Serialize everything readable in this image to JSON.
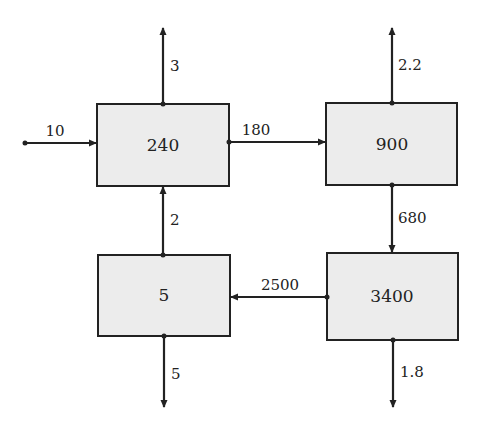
{
  "diagram": {
    "colors": {
      "box_fill": "#ececec",
      "stroke": "#222222",
      "background": "#ffffff"
    },
    "boxes": [
      {
        "id": "box-240",
        "label": "240",
        "x": 97,
        "y": 104,
        "w": 132,
        "h": 82
      },
      {
        "id": "box-900",
        "label": "900",
        "x": 326,
        "y": 103,
        "w": 131,
        "h": 82
      },
      {
        "id": "box-5",
        "label": "5",
        "x": 98,
        "y": 255,
        "w": 132,
        "h": 81
      },
      {
        "id": "box-3400",
        "label": "3400",
        "x": 327,
        "y": 253,
        "w": 131,
        "h": 87
      }
    ],
    "flows": [
      {
        "id": "flow-in-10",
        "label": "10",
        "from": "external",
        "to": "240"
      },
      {
        "id": "flow-out-3",
        "label": "3",
        "from": "240",
        "to": "external"
      },
      {
        "id": "flow-180",
        "label": "180",
        "from": "240",
        "to": "900"
      },
      {
        "id": "flow-out-2-2",
        "label": "2.2",
        "from": "900",
        "to": "external"
      },
      {
        "id": "flow-680",
        "label": "680",
        "from": "900",
        "to": "3400"
      },
      {
        "id": "flow-2500",
        "label": "2500",
        "from": "3400",
        "to": "5"
      },
      {
        "id": "flow-2",
        "label": "2",
        "from": "5",
        "to": "240"
      },
      {
        "id": "flow-out-5",
        "label": "5",
        "from": "5",
        "to": "external"
      },
      {
        "id": "flow-out-1-8",
        "label": "1.8",
        "from": "3400",
        "to": "external"
      }
    ]
  }
}
